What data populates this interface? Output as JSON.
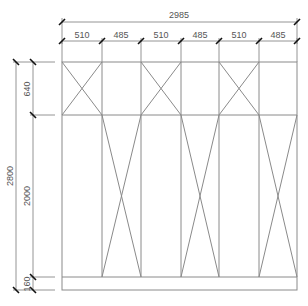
{
  "drawing": {
    "type": "cabinet-elevation",
    "line_color": "#8a8a8a",
    "tick_color": "#111111",
    "text_color": "#555555",
    "overall_width": "2985",
    "panel_widths": [
      "510",
      "485",
      "510",
      "485",
      "510",
      "485"
    ],
    "overall_height": "2800",
    "section_heights": {
      "top": "640",
      "middle": "2000",
      "base": "160"
    },
    "top_cross_panels": [
      1,
      3,
      5
    ],
    "lower_cross_panels": [
      2,
      4,
      6
    ]
  }
}
